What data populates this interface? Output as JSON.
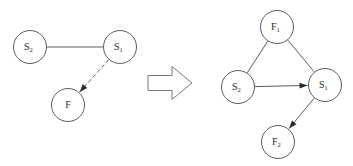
{
  "figure": {
    "background_color": "#ffffff",
    "stroke_color": "#4a4a4a",
    "label_color": "#2b2b2b",
    "width": 353,
    "height": 166
  },
  "transform_arrow": {
    "name": "implies-arrow",
    "glyph": "⇒",
    "direction": "right",
    "style": "hollow-block-arrow",
    "fill": "#ffffff",
    "stroke": "#6a6a6a"
  },
  "left_graph": {
    "name": "before-graph",
    "nodes": [
      {
        "id": "S2",
        "base": "S",
        "sub": "2",
        "cx": 30,
        "cy": 47,
        "r": 16.5
      },
      {
        "id": "S1",
        "base": "S",
        "sub": "1",
        "cx": 120,
        "cy": 47,
        "r": 16.5
      },
      {
        "id": "F",
        "base": "F",
        "sub": "",
        "cx": 68,
        "cy": 105,
        "r": 16.5
      }
    ],
    "edges": [
      {
        "id": "S2-S1",
        "from": "S2",
        "to": "S1",
        "style": "solid",
        "directed": false,
        "label": ""
      },
      {
        "id": "S1-F",
        "from": "S1",
        "to": "F",
        "style": "dashed",
        "directed": true,
        "label": ""
      }
    ]
  },
  "right_graph": {
    "name": "after-graph",
    "nodes": [
      {
        "id": "F1",
        "base": "F",
        "sub": "1",
        "cx": 277,
        "cy": 27,
        "r": 16.5
      },
      {
        "id": "S2",
        "base": "S",
        "sub": "2",
        "cx": 238,
        "cy": 87,
        "r": 16.5
      },
      {
        "id": "S1",
        "base": "S",
        "sub": "1",
        "cx": 325,
        "cy": 85,
        "r": 16.5
      },
      {
        "id": "F2",
        "base": "F",
        "sub": "2",
        "cx": 278,
        "cy": 142,
        "r": 16.5
      }
    ],
    "edges": [
      {
        "id": "S2-F1",
        "from": "S2",
        "to": "F1",
        "style": "solid",
        "directed": false,
        "label": ""
      },
      {
        "id": "F1-S1",
        "from": "F1",
        "to": "S1",
        "style": "solid",
        "directed": false,
        "label": ""
      },
      {
        "id": "S2-S1",
        "from": "S2",
        "to": "S1",
        "style": "solid",
        "directed": true,
        "label": ""
      },
      {
        "id": "S1-F2",
        "from": "S1",
        "to": "F2",
        "style": "solid",
        "directed": true,
        "label": ""
      }
    ]
  }
}
